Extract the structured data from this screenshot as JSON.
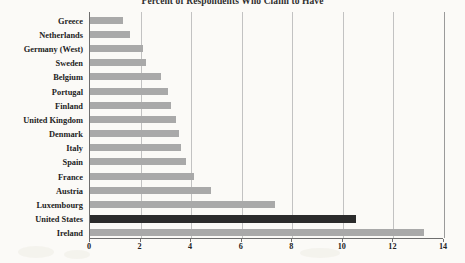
{
  "chart_data": {
    "type": "bar",
    "orientation": "horizontal",
    "title": "Percent of Respondents Who Claim to Have",
    "xlabel": "",
    "ylabel": "",
    "xlim": [
      0,
      14
    ],
    "xticks": [
      0,
      2,
      4,
      6,
      8,
      10,
      12,
      14
    ],
    "xtick_labels": [
      "0",
      "2",
      "4",
      "6",
      "8",
      "10",
      "12",
      "14"
    ],
    "grid": true,
    "grid_axis": "x",
    "legend": "none",
    "categories": [
      "Greece",
      "Netherlands",
      "Germany (West)",
      "Sweden",
      "Belgium",
      "Portugal",
      "Finland",
      "United Kingdom",
      "Denmark",
      "Italy",
      "Spain",
      "France",
      "Austria",
      "Luxembourg",
      "United States",
      "Ireland"
    ],
    "values": [
      1.3,
      1.6,
      2.1,
      2.2,
      2.8,
      3.1,
      3.2,
      3.4,
      3.5,
      3.6,
      3.8,
      4.1,
      4.8,
      7.3,
      10.5,
      13.2
    ],
    "highlight_category": "United States",
    "colors": {
      "bar": "#a9a9a9",
      "bar_highlight": "#2b2b2b",
      "gridline": "#c2c2c2",
      "axis": "#6e6e6e",
      "text": "#232323",
      "background": "#fbfaf7"
    }
  }
}
